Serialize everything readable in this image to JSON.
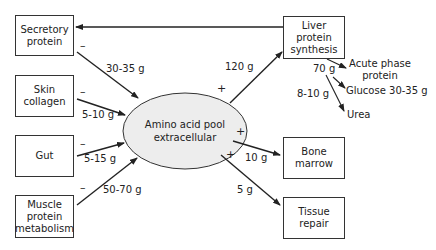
{
  "diagram": {
    "center": {
      "line1": "Amino acid pool",
      "line2": "extracellular"
    },
    "sources": [
      {
        "id": "secretory",
        "line1": "Secretory",
        "line2": "protein",
        "amount": "30-35 g",
        "sign": "–"
      },
      {
        "id": "skin",
        "line1": "Skin",
        "line2": "collagen",
        "amount": "5-10 g",
        "sign": "–"
      },
      {
        "id": "gut",
        "line1": "Gut",
        "amount": "5-15 g",
        "sign": "–"
      },
      {
        "id": "muscle",
        "line1": "Muscle",
        "line2": "protein",
        "line3": "metabolism",
        "amount": "50-70 g",
        "sign": "–"
      }
    ],
    "sinks": [
      {
        "id": "liver",
        "line1": "Liver",
        "line2": "protein",
        "line3": "synthesis",
        "amount": "120 g",
        "sign": "+"
      },
      {
        "id": "bone",
        "line1": "Bone",
        "line2": "marrow",
        "amount": "10 g",
        "sign": "+"
      },
      {
        "id": "tissue",
        "line1": "Tissue",
        "line2": "repair",
        "amount": "5 g",
        "sign": "+"
      }
    ],
    "liver_outputs": {
      "acute_phase": {
        "line1": "Acute phase",
        "line2": "protein",
        "amount": "70 g"
      },
      "glucose": {
        "label": "Glucose 30-35 g"
      },
      "urea": {
        "label": "Urea",
        "amount": "8-10 g"
      }
    }
  }
}
